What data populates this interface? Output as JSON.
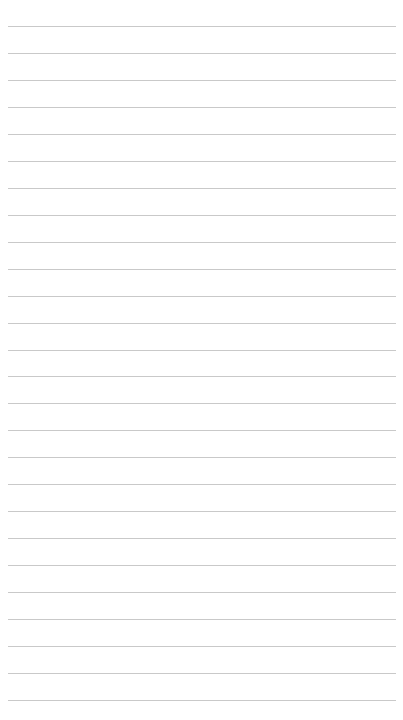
{
  "page": {
    "type": "lined-paper",
    "background_color": "#ffffff",
    "rule_color": "#c9c9c9",
    "rule_count": 26,
    "first_rule_y": 26,
    "rule_spacing": 26.96,
    "rule_left": 8,
    "rule_width": 388
  }
}
